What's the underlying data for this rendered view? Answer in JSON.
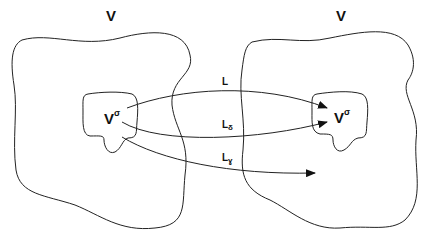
{
  "diagram": {
    "left_space_label": "V",
    "right_space_label": "V",
    "left_subset": {
      "base": "V",
      "sup": "σ"
    },
    "right_subset": {
      "base": "V",
      "sup": "σ"
    },
    "arrows": [
      {
        "base": "L",
        "sub": ""
      },
      {
        "base": "L",
        "sub": "δ"
      },
      {
        "base": "L",
        "sub": "ɣ"
      }
    ]
  }
}
